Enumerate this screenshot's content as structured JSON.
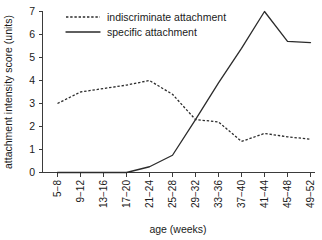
{
  "chart_data": {
    "type": "line",
    "title": "",
    "xlabel": "age (weeks)",
    "ylabel": "attachment intensity score (units)",
    "categories": [
      "5−8",
      "9−12",
      "13−16",
      "17−20",
      "21−24",
      "25−28",
      "29−32",
      "33−36",
      "37−40",
      "41−44",
      "45−48",
      "49−52"
    ],
    "ylim": [
      0,
      7
    ],
    "yticks": [
      0,
      1,
      2,
      3,
      4,
      5,
      6,
      7
    ],
    "ytick_labels": [
      "0",
      "1",
      "2",
      "3",
      "4",
      "5",
      "6",
      "7"
    ],
    "grid": false,
    "legend_position": "top-left",
    "series": [
      {
        "name": "indiscriminate attachment",
        "style": "dashed",
        "color": "#2b2b2b",
        "values": [
          3.0,
          3.5,
          3.65,
          3.8,
          4.0,
          3.4,
          2.3,
          2.2,
          1.35,
          1.7,
          1.55,
          1.45
        ]
      },
      {
        "name": "specific attachment",
        "style": "solid",
        "color": "#2b2b2b",
        "values": [
          0.0,
          0.0,
          0.0,
          0.0,
          0.25,
          0.75,
          2.3,
          3.9,
          5.4,
          7.0,
          5.7,
          5.65
        ]
      }
    ]
  },
  "legend": {
    "items": [
      {
        "label": "indiscriminate attachment",
        "style": "dashed"
      },
      {
        "label": "specific attachment",
        "style": "solid"
      }
    ]
  },
  "axes": {
    "x_title": "age (weeks)",
    "y_title": "attachment intensity score (units)"
  }
}
